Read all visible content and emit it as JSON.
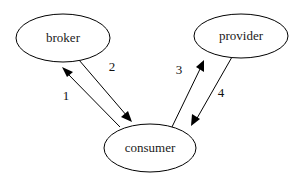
{
  "diagram": {
    "background_color": "#ffffff",
    "stroke_color": "#000000",
    "text_color": "#1a1a1a",
    "nodes": [
      {
        "id": "broker",
        "label": "broker",
        "shape": "ellipse",
        "cx": 63,
        "cy": 38,
        "rx": 47,
        "ry": 24
      },
      {
        "id": "provider",
        "label": "provider",
        "shape": "ellipse",
        "cx": 241,
        "cy": 36,
        "rx": 47,
        "ry": 22
      },
      {
        "id": "consumer",
        "label": "consumer",
        "shape": "ellipse",
        "cx": 150,
        "cy": 148,
        "rx": 46,
        "ry": 24
      }
    ],
    "edges": [
      {
        "id": "edge-1",
        "label": "1",
        "from": "consumer",
        "to": "broker",
        "label_x": 66,
        "label_y": 97,
        "x1": 120,
        "y1": 127,
        "x2": 64,
        "y2": 70
      },
      {
        "id": "edge-2",
        "label": "2",
        "from": "broker",
        "to": "consumer",
        "label_x": 112,
        "label_y": 68,
        "x1": 79,
        "y1": 60,
        "x2": 131,
        "y2": 121
      },
      {
        "id": "edge-3",
        "label": "3",
        "from": "consumer",
        "to": "provider",
        "label_x": 179,
        "label_y": 71,
        "x1": 171,
        "y1": 129,
        "x2": 205,
        "y2": 62
      },
      {
        "id": "edge-4",
        "label": "4",
        "from": "provider",
        "to": "consumer",
        "label_x": 221,
        "label_y": 94,
        "x1": 232,
        "y1": 57,
        "x2": 193,
        "y2": 126
      }
    ]
  }
}
